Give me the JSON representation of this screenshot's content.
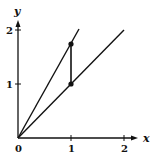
{
  "diagram": {
    "axes": {
      "x_label": "x",
      "y_label": "y",
      "x_ticks": [
        "0",
        "1",
        "2"
      ],
      "y_ticks": [
        "1",
        "2"
      ]
    },
    "lines": [
      {
        "name": "line-y-equals-x",
        "from": [
          0,
          0
        ],
        "to": [
          2,
          2
        ]
      },
      {
        "name": "line-y-equals-sqrt3-x",
        "from": [
          0,
          0
        ],
        "to": [
          1.15,
          2
        ]
      },
      {
        "name": "vertical-segment",
        "from": [
          1,
          1
        ],
        "to": [
          1,
          1.732
        ]
      }
    ],
    "points": [
      {
        "name": "point-1-1",
        "x": 1,
        "y": 1
      },
      {
        "name": "point-1-sqrt3",
        "x": 1,
        "y": 1.732
      }
    ],
    "colors": {
      "ink": "#111111",
      "background": "#ffffff"
    }
  }
}
